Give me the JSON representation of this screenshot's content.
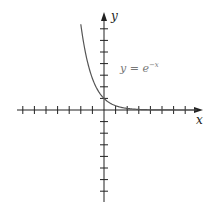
{
  "chart_data": {
    "type": "line",
    "title": "",
    "xlabel": "x",
    "ylabel": "y",
    "annotation": "y = e^{-x}",
    "function": "exp(-x)",
    "x_range_plotted": [
      -2,
      8
    ],
    "series": [
      {
        "name": "y = e^-x",
        "x": [
          -2,
          -1.5,
          -1,
          -0.5,
          0,
          0.5,
          1,
          1.5,
          2,
          3,
          4,
          5,
          6,
          7,
          8
        ],
        "y": [
          7.389,
          4.482,
          2.718,
          1.649,
          1.0,
          0.607,
          0.368,
          0.223,
          0.135,
          0.05,
          0.018,
          0.007,
          0.002,
          0.001,
          0.0003
        ]
      }
    ],
    "axes": {
      "x_ticks": [
        -7,
        -6,
        -5,
        -4,
        -3,
        -2,
        -1,
        1,
        2,
        3,
        4,
        5,
        6,
        7
      ],
      "y_ticks": [
        -7,
        -6,
        -5,
        -4,
        -3,
        -2,
        -1,
        1,
        2,
        3,
        4,
        5,
        6,
        7
      ],
      "xlim": [
        -7.5,
        8.5
      ],
      "ylim": [
        -7.8,
        8.3
      ],
      "tick_labels_shown": false,
      "grid": false
    },
    "legend": null
  },
  "labels": {
    "x_axis": "x",
    "y_axis": "y",
    "eq_base": "y = e",
    "eq_exp": "−x"
  },
  "colors": {
    "axis": "#222222",
    "curve": "#555555",
    "label": "#777777"
  }
}
